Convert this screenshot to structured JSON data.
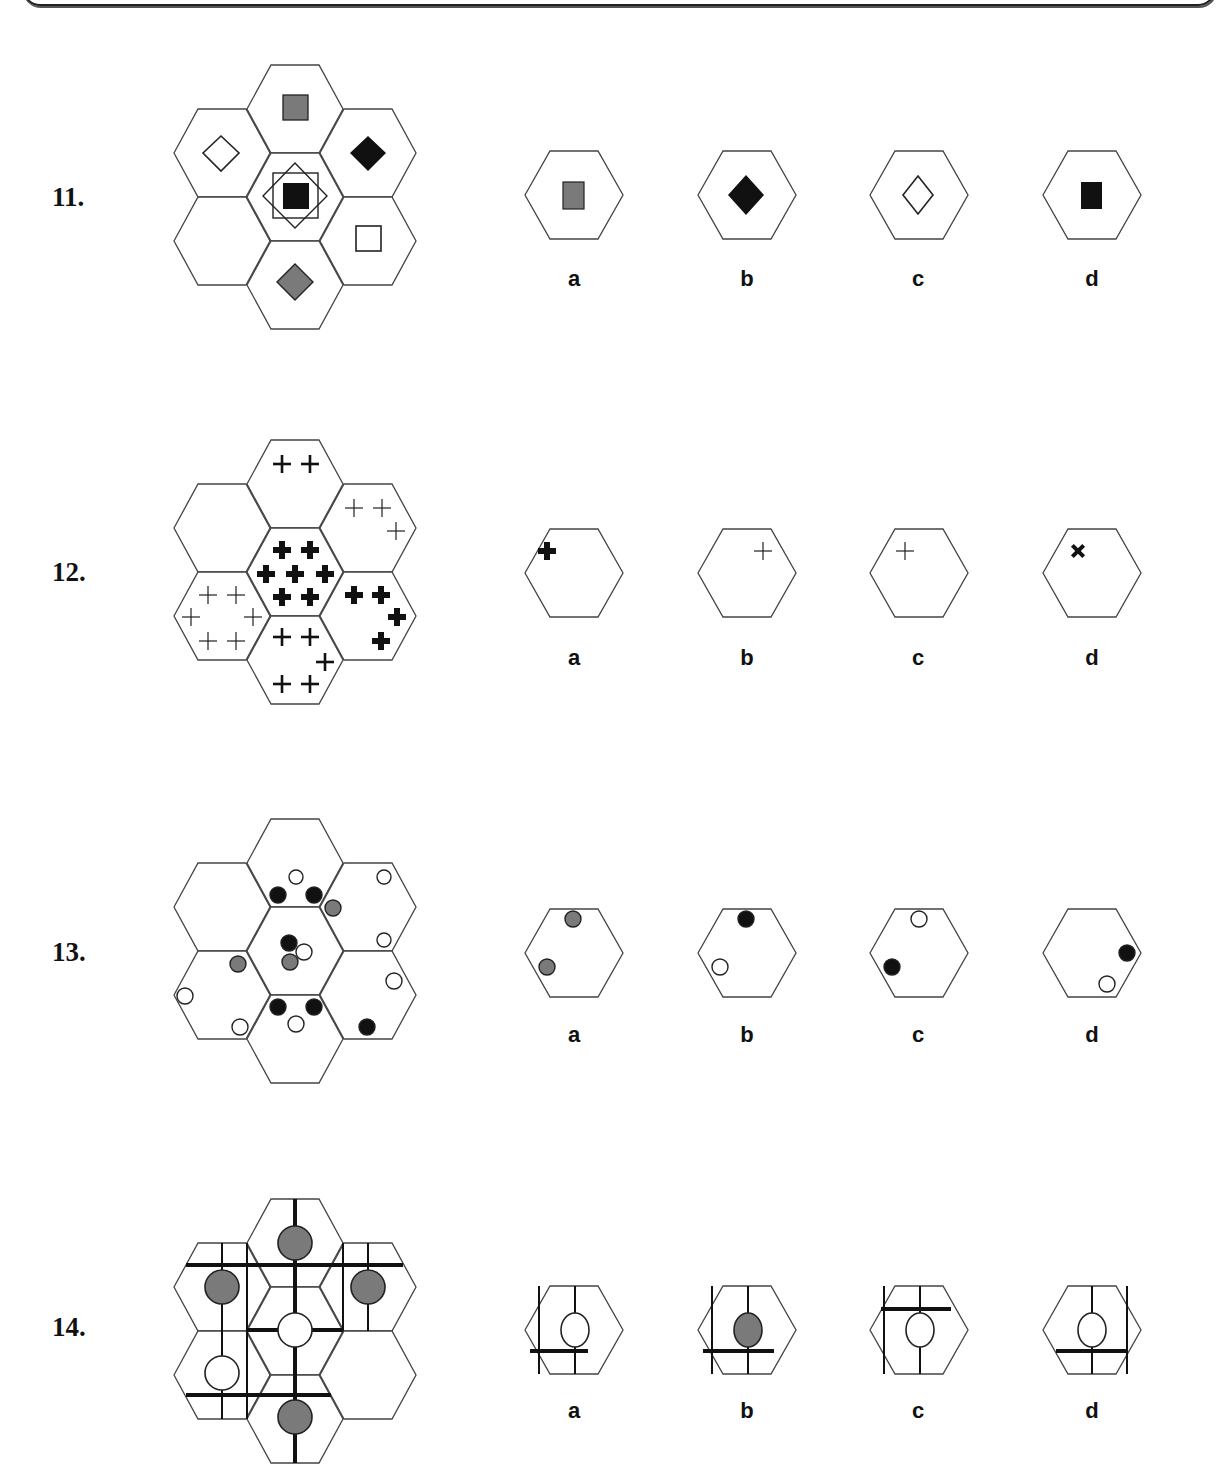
{
  "questions": [
    {
      "number": "11.",
      "options": [
        "a",
        "b",
        "c",
        "d"
      ],
      "grid_description": "7-hex cluster with squares and diamonds; center has black square inside outlined square and outlined diamond; lower-left hex empty",
      "option_contents": [
        "gray square",
        "black diamond",
        "white diamond",
        "black square"
      ]
    },
    {
      "number": "12.",
      "options": [
        "a",
        "b",
        "c",
        "d"
      ],
      "grid_description": "7-hex cluster with plus signs of varying weight; upper-left hex empty",
      "option_contents": [
        "one bold plus top-left",
        "one thin plus top-right",
        "one thin plus top-left",
        "one bold x top-left"
      ]
    },
    {
      "number": "13.",
      "options": [
        "a",
        "b",
        "c",
        "d"
      ],
      "grid_description": "7-hex cluster with black, gray and white circles; upper-left hex empty",
      "option_contents": [
        "two gray circles",
        "black top, white left",
        "white top, black left",
        "black right, white bottom-right"
      ]
    },
    {
      "number": "14.",
      "options": [
        "a",
        "b",
        "c",
        "d"
      ],
      "grid_description": "7-hex cluster with circles and connecting lines; lower-right hex empty",
      "option_contents": [
        "white circle, bar below, left vertical",
        "gray circle, bar below, left vertical",
        "white circle, bar above, left vertical",
        "white circle, bar below, right vertical"
      ]
    }
  ],
  "colors": {
    "black": "#111111",
    "gray": "#7a7a7a",
    "line": "#444444"
  }
}
